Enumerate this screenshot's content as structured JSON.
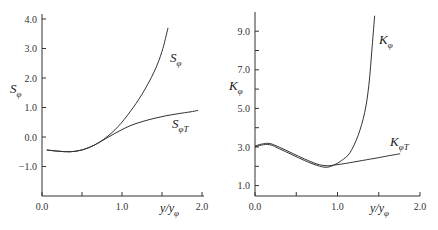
{
  "chart_data": [
    {
      "type": "line",
      "title": "",
      "xlabel": "y/y_φ",
      "ylabel": "S_φ",
      "xlim": [
        0.0,
        2.0
      ],
      "ylim": [
        -2.0,
        4.0
      ],
      "xticks": [
        0.0,
        0.5,
        1.0,
        1.5,
        2.0
      ],
      "xtick_labels": [
        "0.0",
        "",
        "1.0",
        "",
        "2.0"
      ],
      "yticks": [
        4.0,
        3.0,
        2.0,
        1.0,
        0.0,
        -1.0
      ],
      "ytick_labels": [
        "4.0",
        "3.0",
        "2.0",
        "1.0",
        "0.0",
        "-1.0"
      ],
      "grid": false,
      "series": [
        {
          "name": "S_φ",
          "x": [
            0.06,
            0.2,
            0.35,
            0.5,
            0.65,
            0.8,
            0.95,
            1.1,
            1.25,
            1.4,
            1.5,
            1.575
          ],
          "y": [
            -0.44,
            -0.48,
            -0.5,
            -0.44,
            -0.28,
            -0.02,
            0.35,
            0.85,
            1.45,
            2.2,
            2.9,
            3.7
          ]
        },
        {
          "name": "S_φT",
          "x": [
            0.06,
            0.2,
            0.35,
            0.5,
            0.65,
            0.8,
            0.95,
            1.1,
            1.25,
            1.4,
            1.55,
            1.7,
            1.85,
            1.95
          ],
          "y": [
            -0.44,
            -0.48,
            -0.5,
            -0.44,
            -0.28,
            -0.05,
            0.18,
            0.38,
            0.52,
            0.63,
            0.72,
            0.79,
            0.85,
            0.9
          ]
        }
      ],
      "annotations": [
        {
          "text": "S_φ",
          "x": 1.6,
          "y": 2.6
        },
        {
          "text": "S_φT",
          "x": 1.65,
          "y": 0.4
        }
      ]
    },
    {
      "type": "line",
      "title": "",
      "xlabel": "y/y_φ",
      "ylabel": "K_φ",
      "xlim": [
        0.0,
        2.0
      ],
      "ylim": [
        0.45,
        10.0
      ],
      "xticks": [
        0.0,
        0.5,
        1.0,
        1.5,
        2.0
      ],
      "xtick_labels": [
        "0.0",
        "",
        "1.0",
        "",
        "2.0"
      ],
      "yticks": [
        9.0,
        8.0,
        7.0,
        6.0,
        5.0,
        4.0,
        3.0,
        2.0,
        1.0
      ],
      "ytick_labels": [
        "9.0",
        "",
        "7.0",
        "",
        "5.0",
        "",
        "3.0",
        "",
        "1.0"
      ],
      "grid": false,
      "series": [
        {
          "name": "K_φ",
          "x": [
            0.0,
            0.08,
            0.18,
            0.3,
            0.45,
            0.6,
            0.75,
            0.86,
            0.95,
            1.05,
            1.15,
            1.25,
            1.33,
            1.38,
            1.42,
            1.45
          ],
          "y": [
            3.0,
            3.1,
            3.12,
            2.9,
            2.6,
            2.3,
            2.05,
            1.95,
            2.05,
            2.3,
            2.7,
            3.6,
            4.8,
            6.2,
            8.2,
            9.8
          ]
        },
        {
          "name": "K_φT",
          "x": [
            0.0,
            0.08,
            0.18,
            0.3,
            0.45,
            0.6,
            0.75,
            0.86,
            0.95,
            1.1,
            1.3,
            1.5,
            1.65,
            1.76
          ],
          "y": [
            3.05,
            3.15,
            3.18,
            2.98,
            2.68,
            2.38,
            2.12,
            2.03,
            2.06,
            2.15,
            2.3,
            2.45,
            2.57,
            2.65
          ]
        }
      ],
      "annotations": [
        {
          "text": "K_φ",
          "x": 1.52,
          "y": 8.6
        },
        {
          "text": "K_φT",
          "x": 1.62,
          "y": 3.2
        }
      ]
    }
  ],
  "labels": {
    "left": {
      "ylabel_main": "S",
      "ylabel_sub": "φ",
      "xlabel_main": "y/y",
      "xlabel_sub": "φ",
      "curve1_main": "S",
      "curve1_sub": "φ",
      "curve2_main": "S",
      "curve2_sub": "φT"
    },
    "right": {
      "ylabel_main": "K",
      "ylabel_sub": "φ",
      "xlabel_main": "y/y",
      "xlabel_sub": "φ",
      "curve1_main": "K",
      "curve1_sub": "φ",
      "curve2_main": "K",
      "curve2_sub": "φT"
    }
  }
}
